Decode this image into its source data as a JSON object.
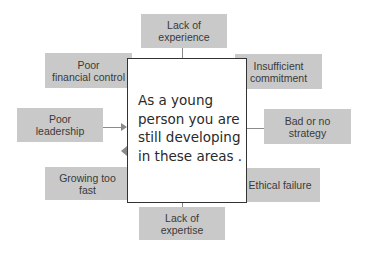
{
  "diagram": {
    "center_text": "As a young\nperson you are\nstill developing\nin these areas .",
    "nodes": [
      {
        "id": "top",
        "label_line1": "Lack of",
        "label_line2": "experience"
      },
      {
        "id": "upper-left",
        "label_line1": "Poor",
        "label_line2": "financial control"
      },
      {
        "id": "upper-right",
        "label_line1": "Insufficient",
        "label_line2": "commitment"
      },
      {
        "id": "mid-left",
        "label_line1": "Poor",
        "label_line2": "leadership"
      },
      {
        "id": "mid-right",
        "label_line1": "Bad or no",
        "label_line2": "strategy"
      },
      {
        "id": "lower-left",
        "label_line1": "Growing too",
        "label_line2": "fast"
      },
      {
        "id": "lower-right",
        "label_line1": "Ethical failure",
        "label_line2": ""
      },
      {
        "id": "bottom",
        "label_line1": "Lack of",
        "label_line2": "expertise"
      }
    ],
    "colors": {
      "node_fill": "#c9c9c9",
      "node_text": "#3a3a3a",
      "connector": "#8a8a8a",
      "center_border": "#333333"
    }
  }
}
